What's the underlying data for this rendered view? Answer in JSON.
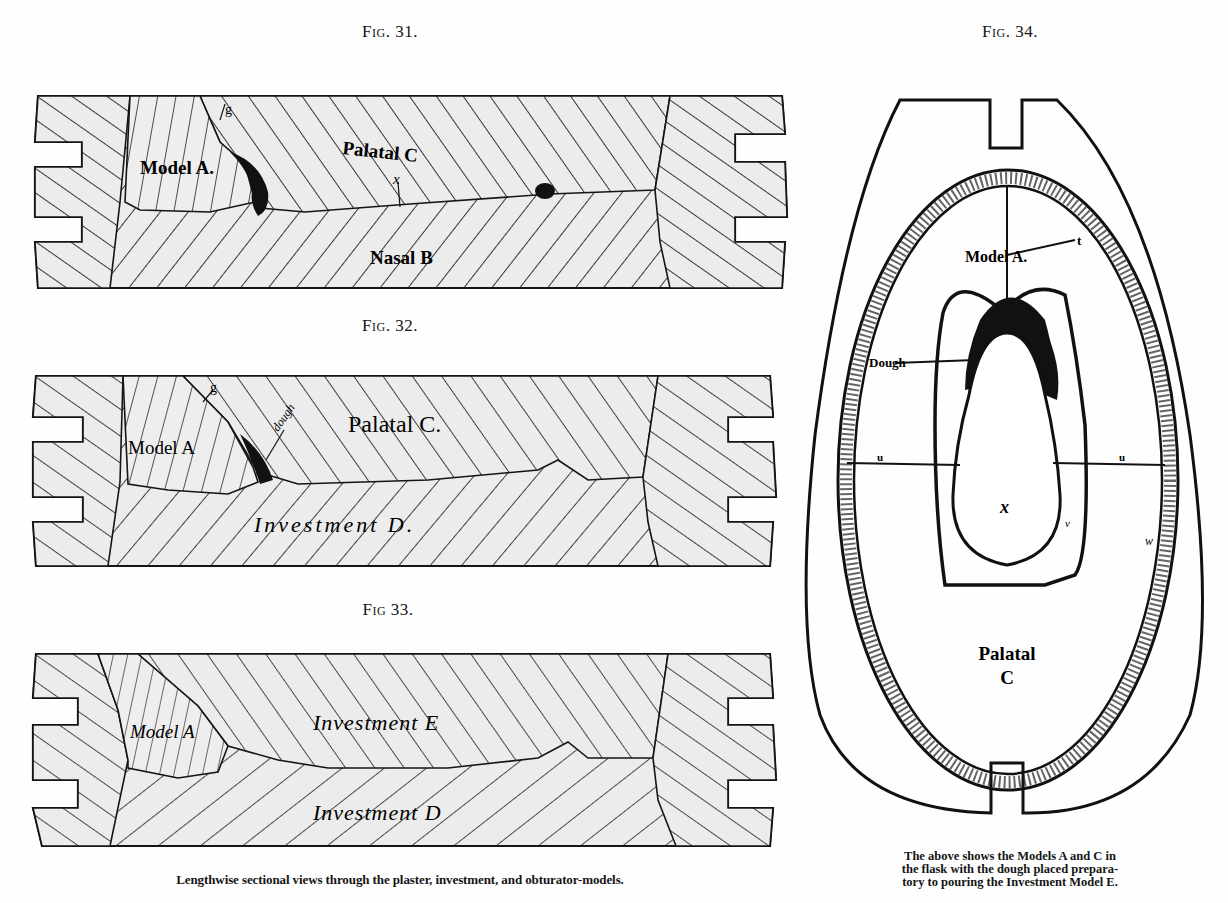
{
  "page": {
    "figures_left": [
      {
        "id": "fig31",
        "label": "Fig. 31.",
        "regions": {
          "model": "Model A.",
          "upper": "Palatal C",
          "lower": "Nasal B",
          "marker_g": "g",
          "marker_x": "x"
        }
      },
      {
        "id": "fig32",
        "label": "Fig. 32.",
        "regions": {
          "model": "Model A",
          "upper": "Palatal C.",
          "lower": "Investment D.",
          "marker_g": "g",
          "dough": "dough"
        }
      },
      {
        "id": "fig33",
        "label": "Fig 33.",
        "regions": {
          "model": "Model A",
          "upper": "Investment E",
          "lower": "Investment D"
        }
      }
    ],
    "figure_right": {
      "id": "fig34",
      "label": "Fig. 34.",
      "regions": {
        "model": "Model A.",
        "marker_t": "t",
        "dough": "Dough",
        "marker_u_left": "u",
        "marker_u_right": "u",
        "center": "x",
        "marker_v": "v",
        "marker_w": "w",
        "palatal": "Palatal",
        "palatal_letter": "C"
      }
    },
    "captions": {
      "left": "Lengthwise sectional views through the plaster, investment, and obturator-models.",
      "right_lines": [
        "The above shows the Models A and C in",
        "the flask with the dough placed prepara-",
        "tory to pouring the Investment Model E."
      ]
    },
    "colors": {
      "ink": "#151515",
      "paper": "#fefefe",
      "hatch_fill": "#ececec"
    }
  }
}
